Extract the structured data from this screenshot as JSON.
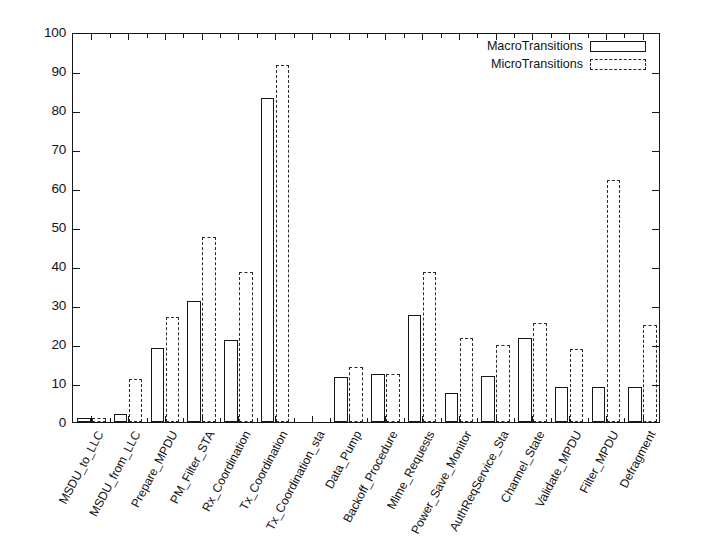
{
  "chart_data": {
    "type": "bar",
    "title": "",
    "xlabel": "",
    "ylabel": "",
    "ylim": [
      0,
      100
    ],
    "ytick_step": 10,
    "ytick_labels": [
      "0",
      "10",
      "20",
      "30",
      "40",
      "50",
      "60",
      "70",
      "80",
      "90",
      "100"
    ],
    "grid": false,
    "legend_position": "top-right",
    "xtick_rotation": -62,
    "categories": [
      "MSDU_to_LLC",
      "MSDU_from_LLC",
      "Prepare_MPDU",
      "PM_Filter_STA",
      "Rx_Coordination",
      "Tx_Coordination",
      "Tx_Coordination_sta",
      "Data_Pump",
      "Backoff_Procedure",
      "Mlme_Requests",
      "Power_Save_Monitor",
      "AuthReqService_Sta",
      "Channel_State",
      "Validate_MPDU",
      "Filter_MPDU",
      "Defragment"
    ],
    "series": [
      {
        "name": "MacroTransitions",
        "style": "solid-outline",
        "values": [
          1,
          2,
          19,
          31,
          21,
          83,
          0,
          11.5,
          12.3,
          27.5,
          7.5,
          11.8,
          21.5,
          9,
          9,
          9
        ]
      },
      {
        "name": "MicroTransitions",
        "style": "dashed-outline",
        "values": [
          1,
          11,
          27,
          47.5,
          38.5,
          91.5,
          0,
          14,
          12.3,
          38.5,
          21.5,
          19.8,
          25.5,
          18.8,
          62,
          25
        ]
      }
    ]
  },
  "legend": {
    "entries": [
      {
        "label": "MacroTransitions",
        "style": "macro"
      },
      {
        "label": "MicroTransitions",
        "style": "micro"
      }
    ]
  }
}
